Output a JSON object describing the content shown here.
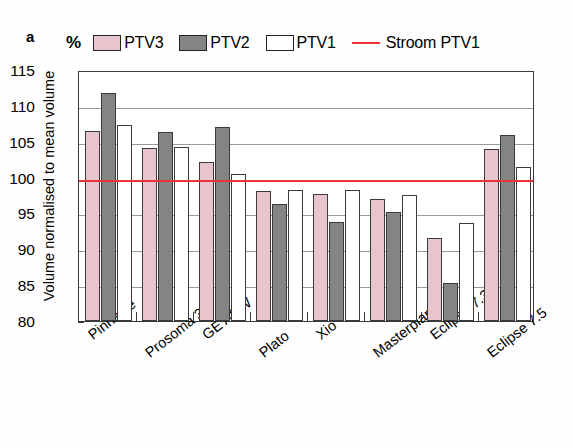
{
  "figure": {
    "panel_label": "a",
    "unit_symbol": "%",
    "y_axis_title": "Volume normalised to mean volume"
  },
  "legend": {
    "items": [
      {
        "label": "PTV3",
        "type": "swatch",
        "color": "#e8c4cc",
        "icon": "pink-square-swatch"
      },
      {
        "label": "PTV2",
        "type": "swatch",
        "color": "#848484",
        "icon": "gray-square-swatch"
      },
      {
        "label": "PTV1",
        "type": "swatch",
        "color": "#ffffff",
        "icon": "white-square-swatch"
      },
      {
        "label": "Stroom PTV1",
        "type": "line",
        "color": "#e8323c",
        "icon": "red-line-swatch"
      }
    ]
  },
  "chart_data": {
    "type": "bar",
    "title": "",
    "xlabel": "",
    "ylabel": "Volume normalised to mean volume",
    "yunit": "%",
    "ylim": [
      80,
      115
    ],
    "yticks": [
      80,
      85,
      90,
      95,
      100,
      105,
      110,
      115
    ],
    "grid": true,
    "legend_position": "top",
    "categories": [
      "Pinnacle",
      "Prosoma 3.0",
      "GE ADW",
      "Plato",
      "Xio",
      "Masterplan",
      "Eclipse 7.3",
      "Eclipse 7.5"
    ],
    "series": [
      {
        "name": "PTV3",
        "color": "#e8c4cc",
        "values": [
          106.5,
          104.1,
          102.2,
          98.1,
          97.7,
          97.0,
          91.6,
          104.0
        ]
      },
      {
        "name": "PTV2",
        "color": "#848484",
        "values": [
          111.8,
          106.4,
          107.0,
          96.3,
          93.8,
          95.2,
          85.3,
          106.0
        ]
      },
      {
        "name": "PTV1",
        "color": "#ffffff",
        "values": [
          107.4,
          104.2,
          100.5,
          98.2,
          98.2,
          97.6,
          93.7,
          101.5
        ]
      }
    ],
    "reference_line": {
      "name": "Stroom PTV1",
      "value": 100,
      "color": "#e8323c"
    }
  }
}
